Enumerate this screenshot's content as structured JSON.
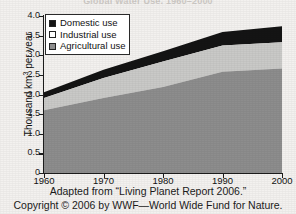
{
  "chart_data": {
    "type": "area",
    "stacked": true,
    "title": "Global Water Use, 1960–2000",
    "xlabel": "",
    "ylabel": "Thousand km³ per year",
    "x": [
      1960,
      1970,
      1980,
      1990,
      2000
    ],
    "xlim": [
      1960,
      2000
    ],
    "ylim": [
      0,
      4.0
    ],
    "xticks": [
      "1960",
      "1970",
      "1980",
      "1990",
      "2000"
    ],
    "yticks": [
      "0",
      "0.5",
      "1.0",
      "1.5",
      "2.0",
      "2.5",
      "3.0",
      "3.5",
      "4.0"
    ],
    "grid": false,
    "legend_position": "top-left",
    "series": [
      {
        "name": "Agricultural use",
        "color": "#8d8d8d",
        "values": [
          1.6,
          1.91,
          2.19,
          2.58,
          2.66
        ]
      },
      {
        "name": "Industrial use",
        "color": "#c9c9c7",
        "values": [
          0.31,
          0.51,
          0.65,
          0.67,
          0.67
        ]
      },
      {
        "name": "Domestic use",
        "color": "#141414",
        "values": [
          0.15,
          0.21,
          0.26,
          0.34,
          0.41
        ]
      }
    ],
    "cumulative_tops": {
      "agricultural": [
        1.6,
        1.91,
        2.19,
        2.58,
        2.66
      ],
      "industrial": [
        1.91,
        2.42,
        2.84,
        3.25,
        3.33
      ],
      "domestic": [
        2.06,
        2.63,
        3.1,
        3.59,
        3.74
      ]
    }
  },
  "legend": {
    "items": [
      {
        "label": "Domestic use",
        "swatch_color": "#141414"
      },
      {
        "label": "Industrial use",
        "swatch_color": "#ffffff"
      },
      {
        "label": "Agricultural use",
        "swatch_color": "#8d8d8d"
      }
    ]
  },
  "axes": {
    "y_title_main": "Thousand km",
    "y_title_sup": "3",
    "y_title_tail": " per year",
    "y_ticks": [
      "4.0",
      "3.5",
      "3.0",
      "2.5",
      "2.0",
      "1.5",
      "1.0",
      "0.5",
      "0"
    ],
    "x_ticks": [
      "1960",
      "1970",
      "1980",
      "1990",
      "2000"
    ]
  },
  "captions": {
    "source": "Adapted from “Living Planet Report 2006.”",
    "copyright": "Copyright © 2006 by WWF—World Wide Fund for Nature."
  },
  "colors": {
    "domestic": "#141414",
    "industrial": "#c9c9c7",
    "agricultural": "#8d8d8d",
    "background": "#f3f1ef",
    "axis": "#1c1c1c"
  }
}
